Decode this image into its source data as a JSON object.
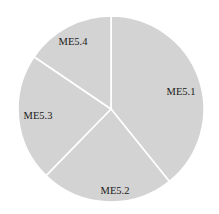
{
  "chart_data": {
    "type": "pie",
    "title": "",
    "categories": [
      "ME5.1",
      "ME5.2",
      "ME5.3",
      "ME5.4"
    ],
    "values": [
      39.2,
      23.1,
      22.2,
      15.5
    ],
    "start_angle_deg": 0,
    "direction": "clockwise",
    "legend": "none",
    "labels_inside": true
  },
  "style": {
    "slice_color": "#d3d3d3",
    "separator_color": "#ffffff",
    "label_color": "#1a1a1a"
  },
  "geometry": {
    "cx": 111,
    "cy": 109,
    "r": 93,
    "label_positions": [
      {
        "x": 181,
        "y": 95
      },
      {
        "x": 115,
        "y": 194
      },
      {
        "x": 38,
        "y": 119
      },
      {
        "x": 73,
        "y": 45
      }
    ]
  }
}
